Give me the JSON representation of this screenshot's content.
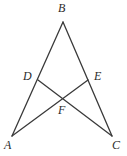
{
  "figure": {
    "type": "geometry-diagram",
    "background_color": "#ffffff",
    "stroke_color": "#3a3a3a",
    "stroke_width": 1.3,
    "label_color": "#2b2b2b",
    "width": 127,
    "height": 156,
    "points": [
      {
        "name": "A",
        "label": "A",
        "x": 12,
        "y": 136,
        "label_x": 4,
        "label_y": 139
      },
      {
        "name": "B",
        "label": "B",
        "x": 63,
        "y": 22,
        "label_x": 58,
        "label_y": 2
      },
      {
        "name": "C",
        "label": "C",
        "x": 112,
        "y": 136,
        "label_x": 112,
        "label_y": 139
      },
      {
        "name": "D",
        "label": "D",
        "x": 38,
        "y": 80,
        "label_x": 23,
        "label_y": 70
      },
      {
        "name": "E",
        "label": "E",
        "x": 88,
        "y": 80,
        "label_x": 94,
        "label_y": 70
      },
      {
        "name": "F",
        "label": "F",
        "x": 64,
        "y": 98,
        "label_x": 58,
        "label_y": 104
      }
    ],
    "segments": [
      {
        "name": "side-AB",
        "from": "B",
        "to": "A"
      },
      {
        "name": "side-BC",
        "from": "B",
        "to": "C"
      },
      {
        "name": "cevian-DC",
        "from": "D",
        "to": "C"
      },
      {
        "name": "cevian-EA",
        "from": "E",
        "to": "A"
      }
    ]
  }
}
